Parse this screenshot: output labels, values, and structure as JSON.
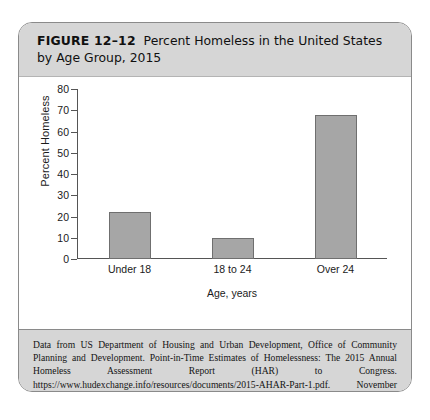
{
  "figure": {
    "number_label": "FIGURE 12–12",
    "title": "Percent Homeless in the United States by Age Group, 2015",
    "caption": "Data from US Department of Housing and Urban Development, Office of Community Planning and Development. Point-in-Time Estimates of Homelessness: The 2015 Annual Homeless Assessment Report (HAR) to Congress. https://www.hudexchange.info/resources/documents/2015-AHAR-Part-1.pdf. November 2015."
  },
  "colors": {
    "bar_fill": "#a6a6a6",
    "bar_edge": "#6f6f6f",
    "band_background": "#d6d6d6",
    "frame_border": "#8a8a8a",
    "axis": "#555555"
  },
  "chart_data": {
    "type": "bar",
    "title": "Percent Homeless in the United States by Age Group, 2015",
    "categories": [
      "Under 18",
      "18 to 24",
      "Over 24"
    ],
    "values": [
      22,
      10,
      68
    ],
    "xlabel": "Age, years",
    "ylabel": "Percent Homeless",
    "ylim": [
      0,
      80
    ],
    "ytick_step": 10,
    "yticks": [
      0,
      10,
      20,
      30,
      40,
      50,
      60,
      70,
      80
    ],
    "ytick_labels": [
      "0",
      "10",
      "20",
      "30",
      "40",
      "50",
      "60",
      "70",
      "80"
    ],
    "grid": false,
    "legend": false
  }
}
